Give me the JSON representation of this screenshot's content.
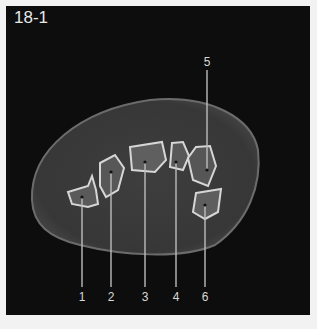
{
  "figure": {
    "label": "18-1"
  },
  "image": {
    "description": "axial CT cross-section of wrist showing carpal bones"
  },
  "callouts": [
    {
      "number": "1",
      "x": 82,
      "line_top": 197,
      "label_y": 297
    },
    {
      "number": "2",
      "x": 111,
      "line_top": 172,
      "label_y": 297
    },
    {
      "number": "3",
      "x": 145,
      "line_top": 162,
      "label_y": 297
    },
    {
      "number": "4",
      "x": 176,
      "line_top": 162,
      "label_y": 297
    },
    {
      "number": "5",
      "x": 207,
      "line_top": 70,
      "line_bottom": 170,
      "label_y": 66
    },
    {
      "number": "6",
      "x": 205,
      "line_top": 205,
      "label_y": 297
    }
  ]
}
